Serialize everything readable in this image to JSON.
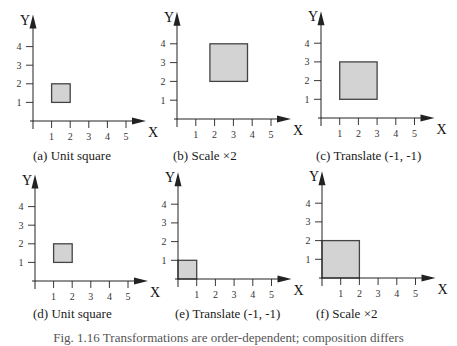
{
  "figure": {
    "caption_partial": "Fig. 1.16 Transformations are order-dependent; composition differs"
  },
  "style": {
    "fill": "#d3d3d3",
    "stroke": "#444444",
    "axis": "#222222"
  },
  "chart_data": [
    {
      "type": "diagram",
      "id": "a",
      "title": "(a) Unit square",
      "xlabel": "X",
      "ylabel": "Y",
      "x_ticks": [
        1,
        2,
        3,
        4,
        5
      ],
      "y_ticks": [
        1,
        2,
        3,
        4
      ],
      "square": {
        "x0": 1,
        "y0": 1,
        "x1": 2,
        "y1": 2
      },
      "origin_px": [
        33,
        121
      ],
      "unit_px": 18.6
    },
    {
      "type": "diagram",
      "id": "b",
      "title": "(b) Scale ×2",
      "xlabel": "X",
      "ylabel": "Y",
      "x_ticks": [
        1,
        2,
        3,
        4,
        5
      ],
      "y_ticks": [
        1,
        2,
        3,
        4
      ],
      "square": {
        "x0": 1.75,
        "y0": 2,
        "x1": 3.75,
        "y1": 4
      },
      "origin_px": [
        177,
        119
      ],
      "unit_px": 18.8
    },
    {
      "type": "diagram",
      "id": "c",
      "title": "(c) Translate (-1, -1)",
      "xlabel": "X",
      "ylabel": "Y",
      "x_ticks": [
        1,
        2,
        3,
        4,
        5
      ],
      "y_ticks": [
        1,
        2,
        3,
        4
      ],
      "square": {
        "x0": 1,
        "y0": 1,
        "x1": 3,
        "y1": 3
      },
      "origin_px": [
        321,
        118
      ],
      "unit_px": 18.7
    },
    {
      "type": "diagram",
      "id": "d",
      "title": "(d) Unit square",
      "xlabel": "X",
      "ylabel": "Y",
      "x_ticks": [
        1,
        2,
        3,
        4,
        5
      ],
      "y_ticks": [
        1,
        2,
        3,
        4
      ],
      "square": {
        "x0": 1,
        "y0": 1,
        "x1": 2,
        "y1": 2
      },
      "origin_px": [
        35,
        281
      ],
      "unit_px": 18.6
    },
    {
      "type": "diagram",
      "id": "e",
      "title": "(e) Translate (-1, -1)",
      "xlabel": "X",
      "ylabel": "Y",
      "x_ticks": [
        1,
        2,
        3,
        4,
        5
      ],
      "y_ticks": [
        1,
        2,
        3,
        4
      ],
      "square": {
        "x0": 0,
        "y0": 0,
        "x1": 1,
        "y1": 1
      },
      "origin_px": [
        178,
        279
      ],
      "unit_px": 18.7
    },
    {
      "type": "diagram",
      "id": "f",
      "title": "(f) Scale ×2",
      "xlabel": "X",
      "ylabel": "Y",
      "x_ticks": [
        1,
        2,
        3,
        4,
        5
      ],
      "y_ticks": [
        1,
        2,
        3,
        4
      ],
      "square": {
        "x0": 0,
        "y0": 0,
        "x1": 2,
        "y1": 2
      },
      "origin_px": [
        322,
        278
      ],
      "unit_px": 18.7
    }
  ],
  "panel_captions": [
    {
      "text": "(a) Unit square",
      "left": 33,
      "top": 148
    },
    {
      "text": "(b) Scale ×2",
      "left": 173,
      "top": 148
    },
    {
      "text": "(c) Translate (-1, -1)",
      "left": 316,
      "top": 148
    },
    {
      "text": "(d) Unit square",
      "left": 33,
      "top": 306
    },
    {
      "text": "(e) Translate (-1, -1)",
      "left": 175,
      "top": 306
    },
    {
      "text": "(f) Scale ×2",
      "left": 316,
      "top": 306
    }
  ]
}
